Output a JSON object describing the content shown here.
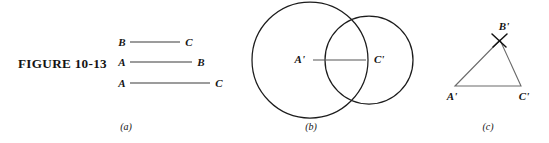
{
  "figure": {
    "caption": "FIGURE 10-13",
    "panel_a_label": "(a)",
    "panel_b_label": "(b)",
    "panel_c_label": "(c)"
  },
  "panel_a": {
    "title": "given segments",
    "segments": [
      {
        "left_label": "B",
        "right_label": "C",
        "length_px": 50
      },
      {
        "left_label": "A",
        "right_label": "B",
        "length_px": 62
      },
      {
        "left_label": "A",
        "right_label": "C",
        "length_px": 80
      }
    ]
  },
  "panel_b": {
    "title": "two construction arcs",
    "center_left_label": "A'",
    "center_right_label": "C'",
    "circles": [
      {
        "name": "large-circle",
        "cx": 310,
        "cy": 60,
        "r": 58
      },
      {
        "name": "small-circle",
        "cx": 369,
        "cy": 60,
        "r": 44
      }
    ],
    "baseline": {
      "x1": 313,
      "y1": 60,
      "x2": 366,
      "y2": 60
    }
  },
  "panel_c": {
    "title": "resulting triangle",
    "vertex_a_label": "A'",
    "vertex_b_label": "B'",
    "vertex_c_label": "C'",
    "vertices": {
      "a": {
        "x": 455,
        "y": 86
      },
      "b": {
        "x": 500,
        "y": 40
      },
      "c": {
        "x": 521,
        "y": 86
      }
    }
  },
  "colors": {
    "ink": "#141414",
    "line": "#3a3a3a",
    "circle_stroke": "#1c1c1c",
    "triangle_stroke": "#6a6a6a",
    "background": "#ffffff"
  }
}
